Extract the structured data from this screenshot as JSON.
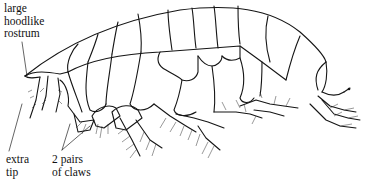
{
  "figure": {
    "labels": {
      "rostrum": [
        "large",
        "hoodlike",
        "rostrum"
      ],
      "extra_tip": [
        "extra",
        "tip"
      ],
      "claws": [
        "2 pairs",
        "of claws"
      ]
    },
    "colors": {
      "ink": "#151515",
      "background": "#ffffff"
    }
  }
}
